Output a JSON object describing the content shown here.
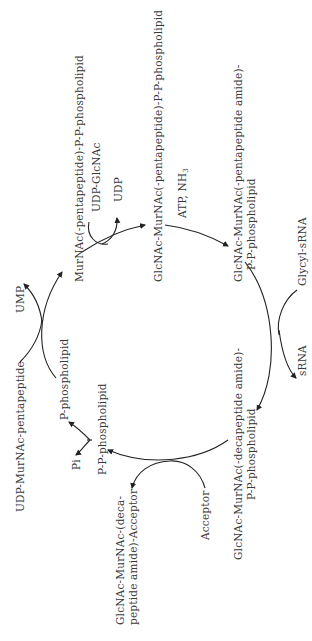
{
  "diagram": {
    "type": "cyclic biochemical pathway",
    "orientation": "rotated -90deg",
    "colors": {
      "text": "#3a3a3a",
      "arrow": "#222222",
      "background": "#ffffff"
    },
    "nodes": {
      "n1": "MurNAc(-pentapeptide)-P-P-phospholipid",
      "n2": "GlcNAc-MurNAc(-pentapeptide)-P-P-phospholipid",
      "n3_line1": "GlcNAc-MurNAc(-pentapeptide amide)-",
      "n3_line2": "P-P-phospholipid",
      "n4_line1": "GlcNAc-MurNAc(-decapeptide amide)-",
      "n4_line2": "P-P-phospholipid",
      "n5": "P-P-phospholipid",
      "n6": "P-phospholipid"
    },
    "side_inputs": {
      "udp_glcnac": "UDP-GlcNAc",
      "atp_nh3": "ATP, NH",
      "atp_nh3_sub": "3",
      "glycyl_srna": "Glycyl-sRNA",
      "acceptor": "Acceptor",
      "udp_murnac": "UDP-MurNAc-pentapeptide"
    },
    "side_outputs": {
      "udp": "UDP",
      "srna": "sRNA",
      "product_line1": "GlcNAc-MurNAc-(deca-",
      "product_line2": "peptide amide)-Acceptor",
      "pi": "Pi",
      "ump": "UMP"
    }
  }
}
